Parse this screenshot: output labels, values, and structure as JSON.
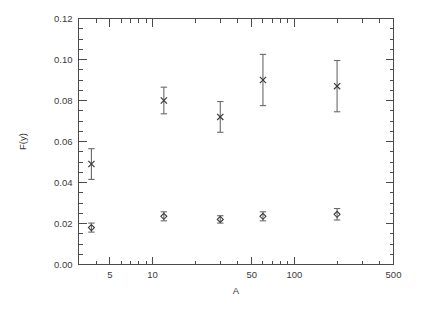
{
  "chart_data": {
    "type": "scatter",
    "title": "",
    "xlabel": "A",
    "ylabel": "F(y)",
    "xscale": "log",
    "yscale": "linear",
    "xlim": [
      3.0,
      500
    ],
    "ylim": [
      0.0,
      0.12
    ],
    "grid": false,
    "legend": null,
    "xticks_major": [
      5,
      10,
      50,
      100,
      500
    ],
    "xticklabels": [
      "5",
      "10",
      "50",
      "100",
      "500"
    ],
    "yticks_major": [
      0.0,
      0.02,
      0.04,
      0.06,
      0.08,
      0.1,
      0.12
    ],
    "yticklabels": [
      "0.00",
      "0.02",
      "0.04",
      "0.06",
      "0.08",
      "0.10",
      "0.12"
    ],
    "series": [
      {
        "name": "upper",
        "marker": "x",
        "x": [
          3.7,
          12.0,
          30.0,
          60.0,
          200.0
        ],
        "values": [
          0.049,
          0.08,
          0.072,
          0.09,
          0.087
        ],
        "yerr": [
          0.0075,
          0.0065,
          0.0075,
          0.0125,
          0.0125
        ]
      },
      {
        "name": "lower",
        "marker": "diamond",
        "x": [
          3.7,
          12.0,
          30.0,
          60.0,
          200.0
        ],
        "values": [
          0.018,
          0.0235,
          0.022,
          0.0235,
          0.0245
        ],
        "yerr": [
          0.0022,
          0.0022,
          0.0018,
          0.0022,
          0.0028
        ]
      }
    ]
  }
}
